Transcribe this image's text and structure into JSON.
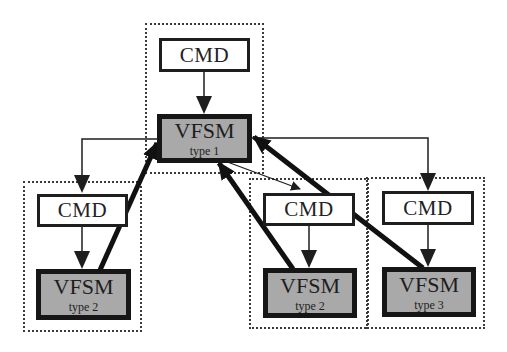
{
  "diagram": {
    "top_group": {
      "cmd": {
        "label": "CMD"
      },
      "vfsm": {
        "label": "VFSM",
        "type": "type 1"
      }
    },
    "left_group": {
      "cmd": {
        "label": "CMD"
      },
      "vfsm": {
        "label": "VFSM",
        "type": "type 2"
      }
    },
    "middle_group": {
      "cmd": {
        "label": "CMD"
      },
      "vfsm": {
        "label": "VFSM",
        "type": "type 2"
      }
    },
    "right_group": {
      "cmd": {
        "label": "CMD"
      },
      "vfsm": {
        "label": "VFSM",
        "type": "type 3"
      }
    },
    "colors": {
      "vfsm_fill": "#a9a9a9",
      "line": "#1e1e1e",
      "background": "#ffffff"
    },
    "edges": [
      {
        "from": "top_group.cmd",
        "to": "top_group.vfsm",
        "style": "thin"
      },
      {
        "from": "top_group.vfsm",
        "to": "left_group.cmd",
        "style": "thin"
      },
      {
        "from": "top_group.vfsm",
        "to": "middle_group.cmd",
        "style": "thin"
      },
      {
        "from": "top_group.vfsm",
        "to": "right_group.cmd",
        "style": "thin"
      },
      {
        "from": "left_group.cmd",
        "to": "left_group.vfsm",
        "style": "thin"
      },
      {
        "from": "middle_group.cmd",
        "to": "middle_group.vfsm",
        "style": "thin"
      },
      {
        "from": "right_group.cmd",
        "to": "right_group.vfsm",
        "style": "thin"
      },
      {
        "from": "left_group.vfsm",
        "to": "top_group.vfsm",
        "style": "thick"
      },
      {
        "from": "middle_group.vfsm",
        "to": "top_group.vfsm",
        "style": "thick"
      },
      {
        "from": "right_group.vfsm",
        "to": "top_group.vfsm",
        "style": "thick"
      }
    ]
  }
}
